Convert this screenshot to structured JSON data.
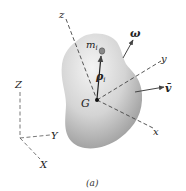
{
  "diagram": {
    "type": "rigid-body-kinematics",
    "body": {
      "name": "rigid-body",
      "center_of_mass_label": "G"
    },
    "particle": {
      "mass_label": "m",
      "mass_subscript": "i",
      "position_label": "ρ",
      "position_subscript": "i"
    },
    "body_axes": {
      "x": "x",
      "y": "y",
      "z": "z"
    },
    "fixed_axes": {
      "X": "X",
      "Y": "Y",
      "Z": "Z"
    },
    "vectors": {
      "angular_velocity": "ω",
      "velocity_of_G": "v̄"
    },
    "caption": "(a)",
    "colors": {
      "line": "#444444",
      "body_light": "#f2f2f2",
      "body_dark": "#9a9a9a"
    }
  }
}
